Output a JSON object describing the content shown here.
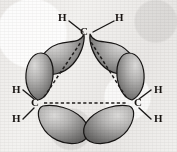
{
  "figure": {
    "molecule": "cyclopropane",
    "background_color": "#efeeec",
    "lobe_fill_light": "#cfcecd",
    "lobe_fill_dark": "#6f6e6d",
    "outline_color": "#171514",
    "bond_line_color": "#1a1817",
    "dashed_line_color": "#201e1d"
  },
  "atoms": {
    "carbons": [
      {
        "id": "c-top",
        "label": "C",
        "x": 84,
        "y": 30
      },
      {
        "id": "c-left",
        "label": "C",
        "x": 34,
        "y": 102
      },
      {
        "id": "c-right",
        "label": "C",
        "x": 133,
        "y": 102
      }
    ],
    "hydrogens": [
      {
        "id": "h-top-left",
        "label": "H",
        "x": 58,
        "y": 12
      },
      {
        "id": "h-top-right",
        "label": "H",
        "x": 115,
        "y": 12
      },
      {
        "id": "h-left-upper",
        "label": "H",
        "x": 12,
        "y": 86
      },
      {
        "id": "h-left-lower",
        "label": "H",
        "x": 12,
        "y": 112
      },
      {
        "id": "h-right-upper",
        "label": "H",
        "x": 152,
        "y": 86
      },
      {
        "id": "h-right-lower",
        "label": "H",
        "x": 152,
        "y": 112
      }
    ]
  },
  "bonds": {
    "ch_lines": [
      {
        "id": "bond-ctop-hleft",
        "x1": 70,
        "y1": 22,
        "x2": 83,
        "y2": 32
      },
      {
        "id": "bond-ctop-hright",
        "x1": 113,
        "y1": 22,
        "x2": 93,
        "y2": 32
      },
      {
        "id": "bond-cleft-hupper",
        "x1": 24,
        "y1": 89,
        "x2": 35,
        "y2": 99
      },
      {
        "id": "bond-cleft-hlower",
        "x1": 24,
        "y1": 118,
        "x2": 35,
        "y2": 108
      },
      {
        "id": "bond-cright-hupper",
        "x1": 150,
        "y1": 89,
        "x2": 140,
        "y2": 99
      },
      {
        "id": "bond-cright-hlower",
        "x1": 150,
        "y1": 118,
        "x2": 140,
        "y2": 108
      }
    ],
    "dashed_triangle": [
      {
        "id": "cc-dash-left",
        "x1": 43,
        "y1": 98,
        "x2": 82,
        "y2": 41
      },
      {
        "id": "cc-dash-right",
        "x1": 127,
        "y1": 98,
        "x2": 90,
        "y2": 41
      },
      {
        "id": "cc-dash-bottom",
        "x1": 44,
        "y1": 104,
        "x2": 127,
        "y2": 104
      }
    ]
  },
  "orbitals": [
    {
      "id": "lobe-top-left",
      "bond": "C-top to C-left",
      "cx": 62,
      "cy": 52,
      "rx": 23,
      "ry": 14,
      "rotate": -28
    },
    {
      "id": "lobe-top-right",
      "bond": "C-top to C-right",
      "cx": 110,
      "cy": 52,
      "rx": 23,
      "ry": 14,
      "rotate": 28
    },
    {
      "id": "lobe-left-upper",
      "bond": "C-left to C-top",
      "cx": 38,
      "cy": 74,
      "rx": 13,
      "ry": 21,
      "rotate": -8
    },
    {
      "id": "lobe-right-upper",
      "bond": "C-right to C-top",
      "cx": 131,
      "cy": 74,
      "rx": 13,
      "ry": 21,
      "rotate": 8
    },
    {
      "id": "lobe-bottom-left",
      "bond": "C-left to C-right",
      "cx": 64,
      "cy": 123,
      "rx": 22,
      "ry": 15,
      "rotate": 18
    },
    {
      "id": "lobe-bottom-right",
      "bond": "C-right to C-left",
      "cx": 110,
      "cy": 123,
      "rx": 22,
      "ry": 15,
      "rotate": -18
    }
  ]
}
